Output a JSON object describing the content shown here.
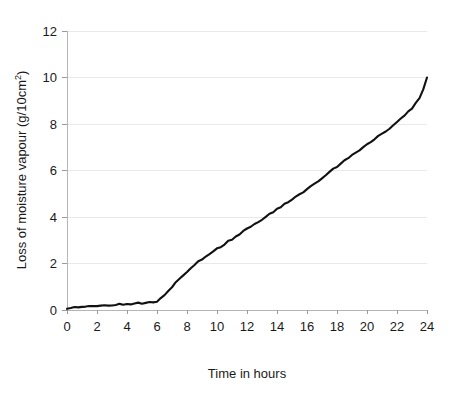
{
  "chart_data": {
    "type": "line",
    "title": "",
    "xlabel": "Time in hours",
    "ylabel": "Loss of moisture vapour  (g/10cm2)",
    "ylabel_parts": {
      "main": "Loss of moisture vapour  (g/10cm",
      "superscript": "2",
      "tail": ")"
    },
    "xlim": [
      0,
      24
    ],
    "ylim": [
      0,
      12
    ],
    "xticks": [
      0,
      2,
      4,
      6,
      8,
      10,
      12,
      14,
      16,
      18,
      20,
      22,
      24
    ],
    "yticks": [
      0,
      2,
      4,
      6,
      8,
      10,
      12
    ],
    "xtick_labels": [
      "0",
      "2",
      "4",
      "6",
      "8",
      "10",
      "12",
      "14",
      "16",
      "18",
      "20",
      "22",
      "24"
    ],
    "ytick_labels": [
      "0",
      "2",
      "4",
      "6",
      "8",
      "10",
      "12"
    ],
    "grid": "horizontal",
    "legend": "none",
    "line_color": "#111111",
    "grid_color": "#e9e9e9",
    "axis_color": "#b5b5b5",
    "series": [
      {
        "name": "Loss of moisture vapour",
        "x": [
          0,
          0.25,
          0.5,
          0.75,
          1,
          1.25,
          1.5,
          1.75,
          2,
          2.25,
          2.5,
          2.75,
          3,
          3.25,
          3.5,
          3.75,
          4,
          4.25,
          4.5,
          4.75,
          5,
          5.25,
          5.5,
          5.75,
          6,
          6.25,
          6.5,
          6.75,
          7,
          7.25,
          7.5,
          7.75,
          8,
          8.25,
          8.5,
          8.75,
          9,
          9.25,
          9.5,
          9.75,
          10,
          10.25,
          10.5,
          10.75,
          11,
          11.25,
          11.5,
          11.75,
          12,
          12.25,
          12.5,
          12.75,
          13,
          13.25,
          13.5,
          13.75,
          14,
          14.25,
          14.5,
          14.75,
          15,
          15.25,
          15.5,
          15.75,
          16,
          16.25,
          16.5,
          16.75,
          17,
          17.25,
          17.5,
          17.75,
          18,
          18.25,
          18.5,
          18.75,
          19,
          19.25,
          19.5,
          19.75,
          20,
          20.25,
          20.5,
          20.75,
          21,
          21.25,
          21.5,
          21.75,
          22,
          22.25,
          22.5,
          22.75,
          23,
          23.25,
          23.5,
          23.75,
          24
        ],
        "y": [
          0.05,
          0.07,
          0.1,
          0.09,
          0.12,
          0.15,
          0.14,
          0.17,
          0.18,
          0.17,
          0.2,
          0.22,
          0.21,
          0.24,
          0.26,
          0.25,
          0.28,
          0.27,
          0.29,
          0.3,
          0.3,
          0.32,
          0.33,
          0.34,
          0.38,
          0.5,
          0.66,
          0.84,
          1.0,
          1.18,
          1.34,
          1.5,
          1.66,
          1.8,
          1.95,
          2.07,
          2.2,
          2.3,
          2.41,
          2.52,
          2.62,
          2.72,
          2.84,
          2.95,
          3.05,
          3.16,
          3.27,
          3.38,
          3.48,
          3.58,
          3.69,
          3.8,
          3.9,
          4.0,
          4.11,
          4.22,
          4.33,
          4.43,
          4.55,
          4.66,
          4.77,
          4.87,
          4.97,
          5.09,
          5.2,
          5.32,
          5.44,
          5.56,
          5.68,
          5.8,
          5.93,
          6.06,
          6.18,
          6.31,
          6.42,
          6.53,
          6.64,
          6.76,
          6.88,
          7.0,
          7.12,
          7.24,
          7.36,
          7.47,
          7.58,
          7.7,
          7.82,
          7.95,
          8.08,
          8.22,
          8.37,
          8.52,
          8.68,
          8.88,
          9.12,
          9.48,
          10.0
        ]
      }
    ]
  },
  "axes": {
    "x_axis_name": "time-axis",
    "y_axis_name": "loss-axis"
  }
}
